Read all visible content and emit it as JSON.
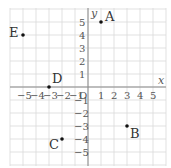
{
  "diagram": {
    "type": "coordinate-plane",
    "x_axis_label": "x",
    "y_axis_label": "y",
    "origin_label": "O",
    "x_range": [
      -5,
      5
    ],
    "y_range": [
      -5,
      5
    ],
    "x_ticks": [
      "−5",
      "−4",
      "−3",
      "−2",
      "−1",
      "1",
      "2",
      "3",
      "4",
      "5"
    ],
    "y_ticks": [
      "5",
      "4",
      "3",
      "2",
      "1",
      "−1",
      "−2",
      "−3",
      "−4",
      "−5"
    ],
    "points": [
      {
        "label": "A",
        "x": 1,
        "y": 5
      },
      {
        "label": "B",
        "x": 3,
        "y": -3
      },
      {
        "label": "C",
        "x": -2,
        "y": -4
      },
      {
        "label": "D",
        "x": -3,
        "y": 0
      },
      {
        "label": "E",
        "x": -5,
        "y": 4
      }
    ]
  }
}
